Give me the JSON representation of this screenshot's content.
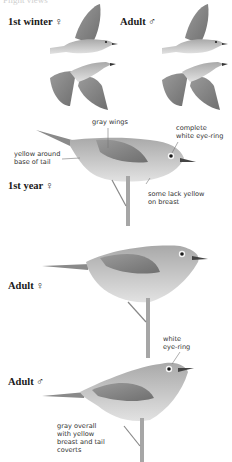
{
  "header": {
    "partial_title": "Flight views"
  },
  "flight_section": {
    "groups": [
      {
        "label": "1st winter ♀"
      },
      {
        "label": "Adult ♂"
      }
    ]
  },
  "perched_section": [
    {
      "label": "1st year ♀",
      "annotations": [
        {
          "id": "wings",
          "text": "gray wings"
        },
        {
          "id": "eyering",
          "text": "complete\nwhite eye-ring"
        },
        {
          "id": "tail",
          "text": "yellow around\nbase of tail"
        },
        {
          "id": "breast",
          "text": "some lack yellow\non breast"
        }
      ]
    },
    {
      "label": "Adult ♀",
      "annotations": []
    },
    {
      "label": "Adult ♂",
      "annotations": [
        {
          "id": "eyering",
          "text": "white\neye-ring"
        },
        {
          "id": "overall",
          "text": "gray overall\nwith yellow\nbreast and tail\ncoverts"
        }
      ]
    }
  ],
  "colors": {
    "background": "#ffffff",
    "bird_body": "#c8c8c8",
    "bird_wing": "#8e8e8e",
    "text": "#1a1a1a"
  }
}
